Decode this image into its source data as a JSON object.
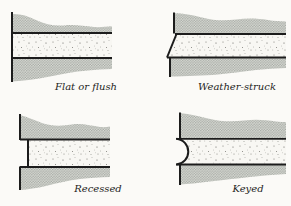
{
  "figure": {
    "panels": [
      {
        "id": "flat-or-flush",
        "label": "Flat or flush"
      },
      {
        "id": "weather-struck",
        "label": "Weather-struck"
      },
      {
        "id": "recessed",
        "label": "Recessed"
      },
      {
        "id": "keyed",
        "label": "Keyed"
      }
    ],
    "colors": {
      "background": "#fbfaf7",
      "brick_halftone_dot": "#a3a7a1",
      "brick_base": "#dcded8",
      "mortar": "#f8f7f3",
      "mortar_speckle": "#74746e",
      "outline": "#1c1c1c"
    }
  }
}
